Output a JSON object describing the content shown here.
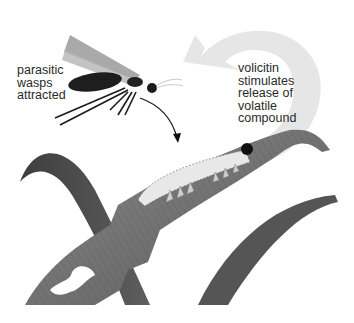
{
  "figure": {
    "type": "biology-illustration",
    "labels": {
      "wasps": "parasitic\nwasps\nattracted",
      "volicitin": "volicitin\nstimulates\nrelease of\nvolatile\ncompound"
    },
    "elements": {
      "wasp": "parasitic wasp",
      "caterpillar": "caterpillar feeding on leaf",
      "leaves": "grass leaf blades with chewed damage",
      "volatile_arrow": "large pale curved arrow from leaf toward wasp",
      "attraction_arrow": "thin black curved arrow from wasp to caterpillar"
    },
    "colors": {
      "leaf_dark": "#4a4a4a",
      "leaf_mid": "#6b6b6b",
      "leaf_light": "#9a9a9a",
      "arrow_pale": "#e6e6e6",
      "wasp_body": "#1e1e1e",
      "caterpillar": "#e8e8e8",
      "text": "#2a2a2a"
    }
  }
}
